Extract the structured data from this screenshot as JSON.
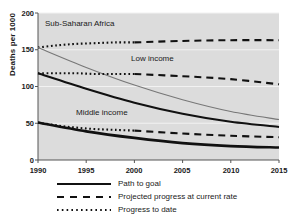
{
  "chart_data": {
    "type": "line",
    "title": "",
    "xlabel": "",
    "ylabel": "Deaths per 1000",
    "xlim": [
      1990,
      2015
    ],
    "ylim": [
      0,
      200
    ],
    "xticks": [
      "1990",
      "1995",
      "2000",
      "2005",
      "2010",
      "2015"
    ],
    "yticks": [
      "0",
      "50",
      "100",
      "150",
      "200"
    ],
    "grid": true,
    "grid_axis": "y",
    "legend_position": "below-axes",
    "annotations": [
      {
        "text": "Sub-Saharan Africa",
        "x": 1992.6,
        "y": 176
      },
      {
        "text": "Low income",
        "x": 1999.7,
        "y": 132
      },
      {
        "text": "Middle income",
        "x": 1995.6,
        "y": 63
      }
    ],
    "legend": [
      {
        "label": "Path to goal",
        "style": "solid"
      },
      {
        "label": "Projected progress at current rate",
        "style": "dashed"
      },
      {
        "label": "Progress to date",
        "style": "dotted"
      }
    ],
    "x": [
      1990,
      1995,
      2000,
      2005,
      2010,
      2015
    ],
    "groups": [
      {
        "name": "Sub-Saharan Africa",
        "series": [
          {
            "name": "Progress to date",
            "style": "dotted",
            "x": [
              1990,
              1992,
              1994,
              1996,
              1998,
              2000
            ],
            "values": [
              153,
              156,
              158,
              159,
              160,
              160
            ]
          },
          {
            "name": "Projected progress at current rate",
            "style": "dashed",
            "x": [
              2000,
              2005,
              2010,
              2015
            ],
            "values": [
              160,
              162,
              163,
              163
            ]
          },
          {
            "name": "Path to goal",
            "style": "solid-thin",
            "x": [
              1990,
              1995,
              2000,
              2005,
              2010,
              2015
            ],
            "values": [
              153,
              126,
              102,
              82,
              66,
              55
            ]
          }
        ]
      },
      {
        "name": "Low income",
        "series": [
          {
            "name": "Progress to date",
            "style": "dotted",
            "x": [
              1990,
              1992,
              1994,
              1996,
              1998,
              2000
            ],
            "values": [
              118,
              118,
              118,
              117,
              117,
              117
            ]
          },
          {
            "name": "Projected progress at current rate",
            "style": "dashed",
            "x": [
              2000,
              2005,
              2010,
              2015
            ],
            "values": [
              117,
              114,
              110,
              103
            ]
          },
          {
            "name": "Path to goal",
            "style": "solid",
            "x": [
              1990,
              1995,
              2000,
              2005,
              2010,
              2015
            ],
            "values": [
              118,
              97,
              78,
              63,
              52,
              45
            ]
          }
        ]
      },
      {
        "name": "Middle income",
        "series": [
          {
            "name": "Progress to date",
            "style": "dotted",
            "x": [
              1990,
              1992,
              1994,
              1996,
              1998,
              2000
            ],
            "values": [
              51,
              47,
              44,
              42,
              41,
              40
            ]
          },
          {
            "name": "Projected progress at current rate",
            "style": "dashed",
            "x": [
              2000,
              2005,
              2010,
              2015
            ],
            "values": [
              40,
              36,
              33,
              31
            ]
          },
          {
            "name": "Path to goal",
            "style": "solid-thick",
            "x": [
              1990,
              1995,
              2000,
              2005,
              2010,
              2015
            ],
            "values": [
              51,
              39,
              30,
              23,
              19,
              17
            ]
          }
        ]
      }
    ]
  },
  "axis": {
    "y_title": "Deaths per 1000",
    "y_ticks": [
      "200",
      "150",
      "100",
      "50",
      "0"
    ],
    "x_ticks": [
      "1990",
      "1995",
      "2000",
      "2005",
      "2010",
      "2015"
    ]
  },
  "series_labels": {
    "ssa": "Sub-Saharan Africa",
    "low": "Low income",
    "middle": "Middle income"
  },
  "legend": {
    "path_to_goal": "Path to goal",
    "projected": "Projected progress at current rate",
    "progress_to_date": "Progress to date"
  },
  "colors": {
    "plot_background": "#dcdcdc",
    "line_dark": "#111111",
    "line_gray": "#777777",
    "gridline": "#f2f2f2",
    "axis": "#555555",
    "text": "#1a1a1a"
  }
}
